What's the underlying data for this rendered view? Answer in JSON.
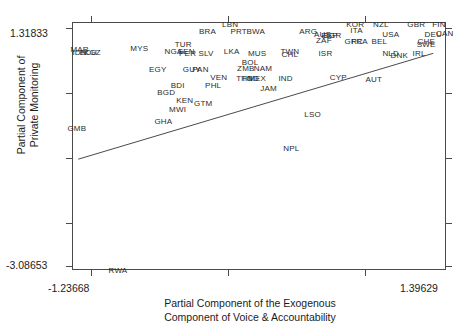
{
  "chart_data": {
    "type": "scatter",
    "title": "",
    "xlabel": "Partial Component of the Exogenous Component of Voice & Accountability",
    "xlabel_line1": "Partial Component of the Exogenous",
    "xlabel_line2": "Component of Voice & Accountability",
    "ylabel": "Partial Component of Private Monitoring",
    "ylabel_line1": "Partial Component of",
    "ylabel_line2": "Private Monitoring",
    "xlim": [
      -1.23668,
      1.39629
    ],
    "ylim": [
      -3.08653,
      1.31833
    ],
    "x_tick_labels": [
      "-1.23668",
      "1.39629"
    ],
    "y_tick_labels": [
      "1.31833",
      "-3.08653"
    ],
    "grid": false,
    "legend": "none",
    "marker_style": "text-label-iso3",
    "fit_line": {
      "present": true,
      "x_start": -1.2,
      "y_start": -1.1,
      "x_end": 1.3,
      "y_end": 0.78
    },
    "points": [
      {
        "label": "LBN",
        "x": -0.13,
        "y": 1.3
      },
      {
        "label": "KOR",
        "x": 0.75,
        "y": 1.3
      },
      {
        "label": "NZL",
        "x": 0.93,
        "y": 1.3
      },
      {
        "label": "GBR",
        "x": 1.18,
        "y": 1.3
      },
      {
        "label": "FIN",
        "x": 1.34,
        "y": 1.3
      },
      {
        "label": "ITA",
        "x": 0.76,
        "y": 1.19
      },
      {
        "label": "BRA",
        "x": -0.29,
        "y": 1.18
      },
      {
        "label": "PRT",
        "x": -0.07,
        "y": 1.18
      },
      {
        "label": "BWA",
        "x": 0.05,
        "y": 1.18
      },
      {
        "label": "ARG",
        "x": 0.42,
        "y": 1.18
      },
      {
        "label": "AUS",
        "x": 0.52,
        "y": 1.13
      },
      {
        "label": "ESP",
        "x": 0.57,
        "y": 1.1
      },
      {
        "label": "BGR",
        "x": 0.59,
        "y": 1.1
      },
      {
        "label": "USA",
        "x": 1.0,
        "y": 1.12
      },
      {
        "label": "DEU",
        "x": 1.3,
        "y": 1.12
      },
      {
        "label": "CAN",
        "x": 1.38,
        "y": 1.14
      },
      {
        "label": "ZAF",
        "x": 0.53,
        "y": 1.02
      },
      {
        "label": "GRC",
        "x": 0.74,
        "y": 1.0
      },
      {
        "label": "FRA",
        "x": 0.78,
        "y": 1.0
      },
      {
        "label": "BEL",
        "x": 0.92,
        "y": 1.0
      },
      {
        "label": "CHE",
        "x": 1.25,
        "y": 1.0
      },
      {
        "label": "SWE",
        "x": 1.25,
        "y": 0.95
      },
      {
        "label": "MAR",
        "x": -1.19,
        "y": 0.86
      },
      {
        "label": "MYS",
        "x": -0.77,
        "y": 0.88
      },
      {
        "label": "TUR",
        "x": -0.46,
        "y": 0.95
      },
      {
        "label": "IDN",
        "x": -1.19,
        "y": 0.8
      },
      {
        "label": "ECU",
        "x": -1.13,
        "y": 0.8
      },
      {
        "label": "KGZ",
        "x": -1.1,
        "y": 0.8
      },
      {
        "label": "NGA",
        "x": -0.53,
        "y": 0.83
      },
      {
        "label": "SEN",
        "x": -0.44,
        "y": 0.82
      },
      {
        "label": "PER",
        "x": -0.43,
        "y": 0.78
      },
      {
        "label": "SLV",
        "x": -0.3,
        "y": 0.79
      },
      {
        "label": "LKA",
        "x": -0.12,
        "y": 0.82
      },
      {
        "label": "MUS",
        "x": 0.06,
        "y": 0.78
      },
      {
        "label": "TWN",
        "x": 0.29,
        "y": 0.83
      },
      {
        "label": "CHL",
        "x": 0.29,
        "y": 0.77
      },
      {
        "label": "ISR",
        "x": 0.54,
        "y": 0.78
      },
      {
        "label": "NLD",
        "x": 1.0,
        "y": 0.79
      },
      {
        "label": "DNK",
        "x": 1.06,
        "y": 0.75
      },
      {
        "label": "IRL",
        "x": 1.2,
        "y": 0.78
      },
      {
        "label": "BOL",
        "x": 0.01,
        "y": 0.62
      },
      {
        "label": "EGY",
        "x": -0.64,
        "y": 0.5
      },
      {
        "label": "GUY",
        "x": -0.4,
        "y": 0.5
      },
      {
        "label": "PAN",
        "x": -0.34,
        "y": 0.5
      },
      {
        "label": "ZMB",
        "x": -0.02,
        "y": 0.52
      },
      {
        "label": "NAM",
        "x": 0.1,
        "y": 0.52
      },
      {
        "label": "VEN",
        "x": -0.21,
        "y": 0.36
      },
      {
        "label": "TTO",
        "x": -0.03,
        "y": 0.35
      },
      {
        "label": "HND",
        "x": 0.01,
        "y": 0.35
      },
      {
        "label": "MEX",
        "x": 0.06,
        "y": 0.35
      },
      {
        "label": "IND",
        "x": 0.26,
        "y": 0.35
      },
      {
        "label": "CYP",
        "x": 0.63,
        "y": 0.36
      },
      {
        "label": "AUT",
        "x": 0.88,
        "y": 0.33
      },
      {
        "label": "BDI",
        "x": -0.5,
        "y": 0.22
      },
      {
        "label": "PHL",
        "x": -0.25,
        "y": 0.22
      },
      {
        "label": "JAM",
        "x": 0.14,
        "y": 0.16
      },
      {
        "label": "BGD",
        "x": -0.58,
        "y": 0.1
      },
      {
        "label": "KEN",
        "x": -0.45,
        "y": -0.05
      },
      {
        "label": "GTM",
        "x": -0.32,
        "y": -0.11
      },
      {
        "label": "MWI",
        "x": -0.5,
        "y": -0.21
      },
      {
        "label": "LSO",
        "x": 0.45,
        "y": -0.3
      },
      {
        "label": "GHA",
        "x": -0.6,
        "y": -0.42
      },
      {
        "label": "GMB",
        "x": -1.21,
        "y": -0.55
      },
      {
        "label": "NPL",
        "x": 0.3,
        "y": -0.9
      },
      {
        "label": "RWA",
        "x": -0.92,
        "y": -3.06
      }
    ]
  },
  "labels": {
    "y_max": "1.31833",
    "y_min": "-3.08653",
    "x_min": "-1.23668",
    "x_max": "1.39629",
    "x_title_line1": "Partial Component of the Exogenous",
    "x_title_line2": "Component of Voice & Accountability",
    "y_title_line1": "Partial Component of",
    "y_title_line2": "Private Monitoring"
  }
}
